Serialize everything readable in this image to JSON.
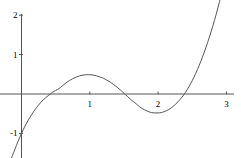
{
  "figure": {
    "width": 241,
    "height": 158,
    "background": "#ffffff",
    "axis_color": "#555555",
    "curve_color": "#555555",
    "label_color": "#000000"
  },
  "chart_data": {
    "type": "line",
    "title": "",
    "subtitle": "",
    "xlabel": "",
    "ylabel": "",
    "legend": [],
    "grid": false,
    "axes_style": "crossed-at-origin",
    "xlim": [
      -0.25,
      3.1
    ],
    "ylim": [
      -1.65,
      2.1
    ],
    "xticks": [
      1,
      2,
      3
    ],
    "xtick_labels": [
      "1",
      "2",
      "3"
    ],
    "yticks": [
      -1,
      1,
      2
    ],
    "ytick_labels": [
      "-1",
      "1",
      "2"
    ],
    "annotations": [],
    "series": [
      {
        "name": "polynomial",
        "color": "#555555",
        "x": [
          -0.16,
          -0.1,
          -0.05,
          0.0,
          0.05,
          0.1,
          0.15,
          0.2,
          0.25,
          0.3,
          0.35,
          0.4,
          0.45,
          0.5,
          0.55,
          0.6,
          0.65,
          0.7,
          0.75,
          0.8,
          0.85,
          0.9,
          0.95,
          1.0,
          1.05,
          1.1,
          1.15,
          1.2,
          1.25,
          1.3,
          1.35,
          1.4,
          1.45,
          1.5,
          1.55,
          1.6,
          1.65,
          1.7,
          1.75,
          1.8,
          1.85,
          1.9,
          1.95,
          2.0,
          2.05,
          2.1,
          2.15,
          2.2,
          2.25,
          2.3,
          2.35,
          2.4,
          2.45,
          2.5,
          2.55,
          2.6,
          2.65,
          2.7,
          2.75,
          2.8,
          2.85,
          2.9,
          2.95,
          3.0,
          3.06
        ],
        "y": [
          -1.68,
          -1.42,
          -1.2,
          -1.0,
          -0.82,
          -0.66,
          -0.52,
          -0.39,
          -0.28,
          -0.18,
          -0.1,
          -0.03,
          0.04,
          0.09,
          0.14,
          0.21,
          0.28,
          0.34,
          0.39,
          0.43,
          0.46,
          0.48,
          0.49,
          0.49,
          0.48,
          0.46,
          0.43,
          0.4,
          0.35,
          0.3,
          0.24,
          0.17,
          0.1,
          0.02,
          -0.06,
          -0.14,
          -0.21,
          -0.28,
          -0.35,
          -0.4,
          -0.44,
          -0.47,
          -0.48,
          -0.48,
          -0.47,
          -0.44,
          -0.4,
          -0.34,
          -0.27,
          -0.18,
          -0.08,
          0.04,
          0.18,
          0.34,
          0.52,
          0.72,
          0.94,
          1.18,
          1.44,
          1.72,
          2.02,
          2.35,
          2.7,
          3.07,
          3.55
        ]
      }
    ],
    "features": {
      "roots": [
        0.42,
        1.52,
        2.43
      ],
      "local_maximum": {
        "x": 0.98,
        "y": 0.49
      },
      "local_minimum": {
        "x": 2.02,
        "y": -0.48
      }
    }
  }
}
